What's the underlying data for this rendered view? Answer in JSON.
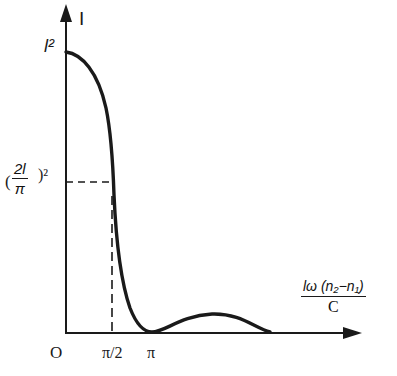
{
  "diagram": {
    "y_axis_label": "I",
    "x_axis_label": {
      "numerator": "lω (n₂−n₁)",
      "denominator": "C"
    },
    "origin_label": "O",
    "y_ticks": [
      {
        "label": "l²"
      },
      {
        "label_open": "(",
        "numerator": "2l",
        "denominator": "π",
        "label_close": ")²"
      }
    ],
    "x_ticks": [
      {
        "label": "π/2"
      },
      {
        "label": "π"
      }
    ],
    "colors": {
      "ink": "#1a1a1a",
      "background": "#ffffff"
    }
  }
}
